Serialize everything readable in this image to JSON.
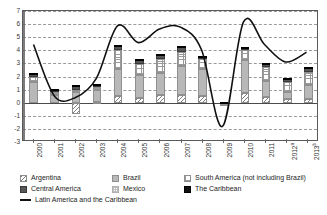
{
  "chart_data": {
    "type": "bar",
    "title": "",
    "subtitle": "",
    "xlabel": "",
    "ylabel": "",
    "ylim": [
      -3,
      7
    ],
    "yticks": [
      -3,
      -2,
      -1,
      0,
      1,
      2,
      3,
      4,
      5,
      6,
      7
    ],
    "ytick_labels": [
      "-3",
      "-2",
      "-1",
      "0",
      "1",
      "2",
      "3",
      "4",
      "5",
      "6",
      "7"
    ],
    "grid": true,
    "stacked": true,
    "legend_position": "bottom",
    "categories": [
      "2000",
      "2001",
      "2002",
      "2003",
      "2004",
      "2005",
      "2006",
      "2007",
      "2008",
      "2009",
      "2010",
      "2011",
      "2012",
      "2013"
    ],
    "category_labels": [
      "2000",
      "2001",
      "2002",
      "2003",
      "2004",
      "2005",
      "2006",
      "2007",
      "2008",
      "2009",
      "2010",
      "2011",
      "2012",
      "2013"
    ],
    "category_superscripts": [
      "",
      "",
      "",
      "",
      "",
      "",
      "",
      "",
      "",
      "",
      "",
      "",
      "a",
      "b"
    ],
    "series": [
      {
        "name": "Argentina",
        "pattern": "diagonal-hatch",
        "values": [
          0,
          0,
          -0.9,
          0.05,
          0.5,
          0.35,
          0.55,
          0.6,
          0.5,
          0,
          0.75,
          0.45,
          0.3,
          0.25
        ]
      },
      {
        "name": "Brazil",
        "pattern": "solid-light-gray",
        "values": [
          1.55,
          0.55,
          0.85,
          0.9,
          2.1,
          1.75,
          1.7,
          2.2,
          2.1,
          -0.1,
          2.5,
          1.2,
          0.55,
          1.1
        ]
      },
      {
        "name": "South America (not including Brazil)",
        "pattern": "grid-dots-medium",
        "values": [
          0.4,
          0.25,
          0.1,
          0.25,
          1.4,
          0.85,
          1.1,
          1.1,
          0.75,
          -0.15,
          0.75,
          1.1,
          0.75,
          1.0
        ]
      },
      {
        "name": "Mexico",
        "pattern": "grid-dots-light",
        "values": [
          0,
          0,
          0,
          0,
          0,
          0,
          0,
          0,
          0,
          0,
          0,
          0,
          0,
          0
        ]
      },
      {
        "name": "Central America",
        "pattern": "solid-dark-gray",
        "values": [
          0.25,
          0.2,
          0.35,
          0.15,
          0.35,
          0.3,
          0.3,
          0.4,
          0.15,
          0.05,
          0.2,
          0.25,
          0.2,
          0.35
        ]
      },
      {
        "name": "The Caribbean",
        "pattern": "solid-black",
        "values": [
          0.05,
          0.05,
          0.05,
          0.05,
          0.05,
          0.05,
          0.05,
          0.05,
          0.05,
          0.02,
          0.05,
          0.05,
          0.05,
          0.05
        ]
      }
    ],
    "line_series": {
      "name": "Latin America and the Caribbean",
      "style": "solid-black-line",
      "values": [
        4.4,
        0.4,
        0.3,
        1.8,
        5.85,
        4.55,
        5.6,
        5.75,
        4.0,
        -1.95,
        6.15,
        4.4,
        3.05,
        3.8
      ]
    },
    "totals": [
      2.25,
      1.05,
      1.35,
      1.3,
      4.35,
      3.3,
      3.7,
      4.35,
      3.55,
      -0.25,
      4.25,
      3.05,
      1.85,
      2.75
    ]
  },
  "legend": {
    "row1": [
      {
        "label": "Argentina",
        "swatch": "argentina-swatch"
      },
      {
        "label": "Brazil",
        "swatch": "brazil-swatch"
      },
      {
        "label": "South America (not including Brazil)",
        "swatch": "south-america-swatch"
      }
    ],
    "row2": [
      {
        "label": "Central America",
        "swatch": "central-america-swatch"
      },
      {
        "label": "Mexico",
        "swatch": "mexico-swatch"
      },
      {
        "label": "The Caribbean",
        "swatch": "caribbean-swatch"
      }
    ],
    "row3": [
      {
        "label": "Latin America and the Caribbean",
        "swatch": "line-swatch"
      }
    ]
  },
  "colors": {
    "brazil": "#b8b8b8",
    "central_america": "#565656",
    "caribbean": "#111111",
    "line": "#111111",
    "grid": "#9a9a9a",
    "axis": "#5a5a5a"
  }
}
